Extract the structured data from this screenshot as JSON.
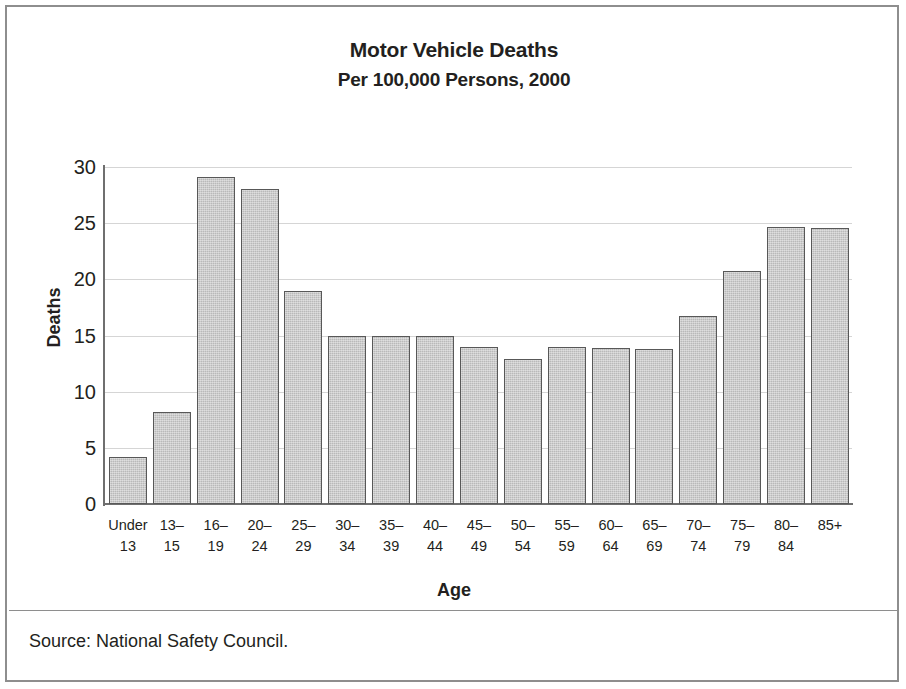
{
  "chart_data": {
    "type": "bar",
    "title": "Motor Vehicle Deaths",
    "subtitle": "Per 100,000 Persons, 2000",
    "xlabel": "Age",
    "ylabel": "Deaths",
    "ylim": [
      0,
      30
    ],
    "yticks": [
      0,
      5,
      10,
      15,
      20,
      25,
      30
    ],
    "ytick_labels": [
      "0",
      "5",
      "10",
      "15",
      "20",
      "25",
      "30"
    ],
    "grid": true,
    "legend": "none",
    "categories": [
      "Under 13",
      "13–15",
      "16–19",
      "20–24",
      "25–29",
      "30–34",
      "35–39",
      "40–44",
      "45–49",
      "50–54",
      "55–59",
      "60–64",
      "65–69",
      "70–74",
      "75–79",
      "80–84",
      "85+"
    ],
    "category_lines": [
      [
        "Under",
        "13"
      ],
      [
        "13–",
        "15"
      ],
      [
        "16–",
        "19"
      ],
      [
        "20–",
        "24"
      ],
      [
        "25–",
        "29"
      ],
      [
        "30–",
        "34"
      ],
      [
        "35–",
        "39"
      ],
      [
        "40–",
        "44"
      ],
      [
        "45–",
        "49"
      ],
      [
        "50–",
        "54"
      ],
      [
        "55–",
        "59"
      ],
      [
        "60–",
        "64"
      ],
      [
        "65–",
        "69"
      ],
      [
        "70–",
        "74"
      ],
      [
        "75–",
        "79"
      ],
      [
        "80–",
        "84"
      ],
      [
        "85+",
        ""
      ]
    ],
    "values": [
      4.2,
      8.2,
      29.1,
      28.0,
      19.0,
      15.0,
      15.0,
      15.0,
      14.0,
      12.9,
      14.0,
      13.9,
      13.8,
      16.7,
      20.7,
      24.7,
      24.6
    ],
    "bar_color": "#b9b9b9",
    "bar_border_color": "#585858",
    "gridline_color": "#d5d5d5",
    "axis_color": "#6f6f6f"
  },
  "source_note": "Source: National Safety Council."
}
